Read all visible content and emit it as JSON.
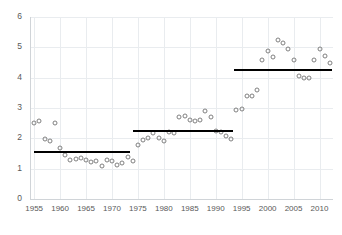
{
  "chart_data": {
    "type": "scatter",
    "title": "",
    "subtitle": "",
    "xlabel": "",
    "ylabel": "",
    "xlim": [
      1954.2,
      2012.6
    ],
    "ylim": [
      0,
      6
    ],
    "grid": true,
    "legend": false,
    "y_ticks": [
      0,
      1,
      2,
      3,
      4,
      5,
      6
    ],
    "x_ticks": [
      1955,
      1960,
      1965,
      1970,
      1975,
      1980,
      1985,
      1990,
      1995,
      2000,
      2005,
      2010
    ],
    "marker": "open-circle",
    "marker_color": "#808080",
    "line_color": "#000000",
    "grid_color": "#e9ecef",
    "series": [
      {
        "name": "observations",
        "x": [
          1955,
          1956,
          1957,
          1958,
          1959,
          1960,
          1961,
          1962,
          1963,
          1964,
          1965,
          1966,
          1967,
          1968,
          1969,
          1970,
          1971,
          1972,
          1973,
          1974,
          1975,
          1976,
          1977,
          1978,
          1979,
          1980,
          1981,
          1982,
          1983,
          1984,
          1985,
          1986,
          1987,
          1988,
          1989,
          1990,
          1991,
          1992,
          1993,
          1994,
          1995,
          1996,
          1997,
          1998,
          1999,
          2000,
          2001,
          2002,
          2003,
          2004,
          2005,
          2006,
          2007,
          2008,
          2009,
          2010,
          2011,
          2012
        ],
        "y": [
          2.5,
          2.58,
          1.98,
          1.92,
          2.5,
          1.68,
          1.44,
          1.3,
          1.32,
          1.36,
          1.3,
          1.21,
          1.26,
          1.09,
          1.28,
          1.25,
          1.11,
          1.2,
          1.37,
          1.26,
          1.78,
          1.93,
          2.0,
          2.18,
          2.0,
          1.9,
          2.22,
          2.18,
          2.7,
          2.72,
          2.62,
          2.57,
          2.6,
          2.9,
          2.7,
          2.25,
          2.22,
          2.09,
          1.98,
          2.92,
          2.98,
          3.38,
          3.4,
          3.58,
          4.58,
          4.88,
          4.68,
          5.25,
          5.15,
          4.96,
          4.57,
          4.07,
          3.99,
          3.98,
          4.57,
          4.96,
          4.7,
          4.48
        ]
      }
    ],
    "step_means": [
      {
        "label": "regime-1",
        "x_start": 1955,
        "x_end": 1973.5,
        "value": 1.55
      },
      {
        "label": "regime-2",
        "x_start": 1974.0,
        "x_end": 1993.4,
        "value": 2.25
      },
      {
        "label": "regime-3",
        "x_start": 1993.6,
        "x_end": 2012.4,
        "value": 4.25
      }
    ]
  }
}
